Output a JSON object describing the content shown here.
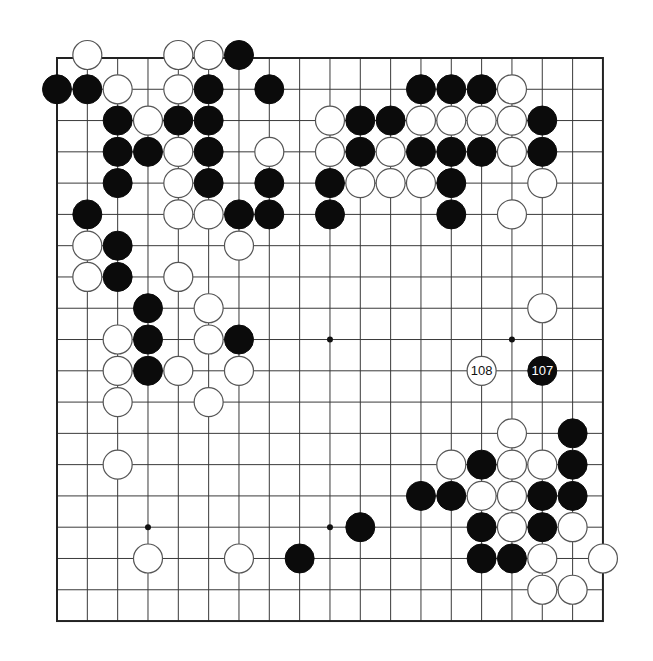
{
  "board": {
    "size": 19,
    "origin_x": 57,
    "origin_y": 58,
    "spacing_x": 30.33,
    "spacing_y": 31.28,
    "stone_radius": 14.5,
    "colors": {
      "black": "#0b0b0b",
      "white": "#ffffff",
      "line": "#3a3a3a"
    },
    "hoshi": [
      [
        3,
        3
      ],
      [
        9,
        3
      ],
      [
        15,
        3
      ],
      [
        3,
        9
      ],
      [
        9,
        9
      ],
      [
        15,
        9
      ],
      [
        3,
        15
      ],
      [
        9,
        15
      ],
      [
        15,
        15
      ]
    ],
    "black_stones": [
      [
        6,
        0
      ],
      [
        0,
        1
      ],
      [
        1,
        1
      ],
      [
        5,
        1
      ],
      [
        7,
        1
      ],
      [
        12,
        1
      ],
      [
        13,
        1
      ],
      [
        14,
        1
      ],
      [
        2,
        2
      ],
      [
        4,
        2
      ],
      [
        5,
        2
      ],
      [
        10,
        2
      ],
      [
        11,
        2
      ],
      [
        16,
        2
      ],
      [
        2,
        3
      ],
      [
        3,
        3
      ],
      [
        5,
        3
      ],
      [
        10,
        3
      ],
      [
        12,
        3
      ],
      [
        13,
        3
      ],
      [
        14,
        3
      ],
      [
        16,
        3
      ],
      [
        2,
        4
      ],
      [
        5,
        4
      ],
      [
        7,
        4
      ],
      [
        9,
        4
      ],
      [
        13,
        4
      ],
      [
        1,
        5
      ],
      [
        6,
        5
      ],
      [
        7,
        5
      ],
      [
        9,
        5
      ],
      [
        13,
        5
      ],
      [
        2,
        6
      ],
      [
        2,
        7
      ],
      [
        3,
        8
      ],
      [
        3,
        9
      ],
      [
        6,
        9
      ],
      [
        3,
        10
      ],
      [
        17,
        12
      ],
      [
        14,
        13
      ],
      [
        17,
        13
      ],
      [
        12,
        14
      ],
      [
        13,
        14
      ],
      [
        16,
        14
      ],
      [
        17,
        14
      ],
      [
        10,
        15
      ],
      [
        14,
        15
      ],
      [
        16,
        15
      ],
      [
        8,
        16
      ],
      [
        14,
        16
      ],
      [
        15,
        16
      ]
    ],
    "white_stones": [
      [
        1,
        0
      ],
      [
        4,
        0
      ],
      [
        5,
        0
      ],
      [
        2,
        1
      ],
      [
        4,
        1
      ],
      [
        15,
        1
      ],
      [
        3,
        2
      ],
      [
        9,
        2
      ],
      [
        12,
        2
      ],
      [
        13,
        2
      ],
      [
        14,
        2
      ],
      [
        15,
        2
      ],
      [
        4,
        3
      ],
      [
        7,
        3
      ],
      [
        9,
        3
      ],
      [
        11,
        3
      ],
      [
        15,
        3
      ],
      [
        4,
        4
      ],
      [
        10,
        4
      ],
      [
        11,
        4
      ],
      [
        12,
        4
      ],
      [
        16,
        4
      ],
      [
        4,
        5
      ],
      [
        5,
        5
      ],
      [
        15,
        5
      ],
      [
        1,
        6
      ],
      [
        6,
        6
      ],
      [
        1,
        7
      ],
      [
        4,
        7
      ],
      [
        5,
        8
      ],
      [
        16,
        8
      ],
      [
        2,
        9
      ],
      [
        5,
        9
      ],
      [
        2,
        10
      ],
      [
        4,
        10
      ],
      [
        6,
        10
      ],
      [
        2,
        11
      ],
      [
        5,
        11
      ],
      [
        15,
        12
      ],
      [
        2,
        13
      ],
      [
        13,
        13
      ],
      [
        15,
        13
      ],
      [
        16,
        13
      ],
      [
        14,
        14
      ],
      [
        15,
        14
      ],
      [
        15,
        15
      ],
      [
        17,
        15
      ],
      [
        3,
        16
      ],
      [
        6,
        16
      ],
      [
        16,
        16
      ],
      [
        18,
        16
      ],
      [
        16,
        17
      ],
      [
        17,
        17
      ]
    ],
    "numbered_moves": [
      {
        "number": "107",
        "color": "black",
        "col": 16,
        "row": 10
      },
      {
        "number": "108",
        "color": "white",
        "col": 14,
        "row": 10
      }
    ]
  }
}
